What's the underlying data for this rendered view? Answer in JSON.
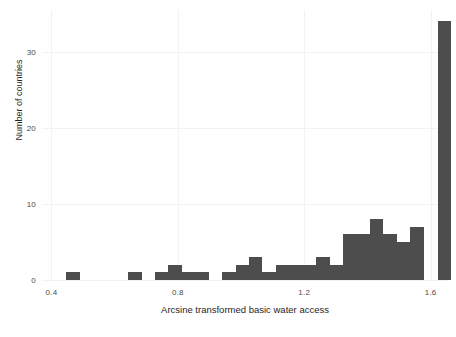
{
  "chart_data": {
    "type": "bar",
    "title": "",
    "subtitle": "",
    "xlabel": "Arcsine transformed basic water access",
    "ylabel": "Number of countries",
    "xlim": [
      0.37,
      1.655
    ],
    "ylim": [
      0,
      35.5
    ],
    "xticks": [
      0.4,
      0.8,
      1.2,
      1.6
    ],
    "xtick_labels": [
      "0.4",
      "0.8",
      "1.2",
      "1.6"
    ],
    "yticks": [
      0,
      10,
      20,
      30
    ],
    "ytick_labels": [
      "0",
      "10",
      "20",
      "30"
    ],
    "grid": true,
    "legend": null,
    "bar_color": "#4d4d4d",
    "background_color": "#ffffff",
    "gridline_color": "#f2f2f2",
    "bin_width": 0.0425,
    "bins": [
      {
        "x0": 0.4475,
        "x1": 0.49,
        "value": 1
      },
      {
        "x0": 0.6425,
        "x1": 0.685,
        "value": 1
      },
      {
        "x0": 0.7275,
        "x1": 0.77,
        "value": 1
      },
      {
        "x0": 0.77,
        "x1": 0.8125,
        "value": 2
      },
      {
        "x0": 0.8125,
        "x1": 0.855,
        "value": 1
      },
      {
        "x0": 0.855,
        "x1": 0.8975,
        "value": 1
      },
      {
        "x0": 0.94,
        "x1": 0.9825,
        "value": 1
      },
      {
        "x0": 0.9825,
        "x1": 1.025,
        "value": 2
      },
      {
        "x0": 1.025,
        "x1": 1.0675,
        "value": 3
      },
      {
        "x0": 1.0675,
        "x1": 1.11,
        "value": 1
      },
      {
        "x0": 1.11,
        "x1": 1.1525,
        "value": 2
      },
      {
        "x0": 1.1525,
        "x1": 1.195,
        "value": 2
      },
      {
        "x0": 1.195,
        "x1": 1.2375,
        "value": 2
      },
      {
        "x0": 1.2375,
        "x1": 1.28,
        "value": 3
      },
      {
        "x0": 1.28,
        "x1": 1.3225,
        "value": 2
      },
      {
        "x0": 1.3225,
        "x1": 1.365,
        "value": 6
      },
      {
        "x0": 1.365,
        "x1": 1.4075,
        "value": 6
      },
      {
        "x0": 1.4075,
        "x1": 1.45,
        "value": 8
      },
      {
        "x0": 1.45,
        "x1": 1.4925,
        "value": 6
      },
      {
        "x0": 1.4925,
        "x1": 1.535,
        "value": 5
      },
      {
        "x0": 1.535,
        "x1": 1.5775,
        "value": 7
      },
      {
        "x0": 1.6225,
        "x1": 1.665,
        "value": 34
      }
    ]
  }
}
